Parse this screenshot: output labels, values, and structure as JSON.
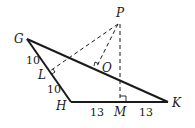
{
  "diagram": {
    "type": "geometry",
    "points": {
      "G": {
        "label": "G"
      },
      "H": {
        "label": "H"
      },
      "K": {
        "label": "K"
      },
      "P": {
        "label": "P"
      },
      "L": {
        "label": "L"
      },
      "O": {
        "label": "O"
      },
      "M": {
        "label": "M"
      }
    },
    "segment_lengths": {
      "GL": "10",
      "LH": "10",
      "HM": "13",
      "MK": "13"
    },
    "colors": {
      "stroke": "#1a1a1a",
      "background": "#ffffff"
    }
  }
}
